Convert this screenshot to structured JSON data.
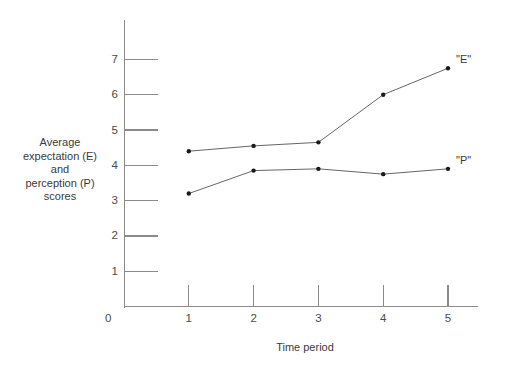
{
  "chart_data": {
    "type": "line",
    "title": "",
    "xlabel": "Time period",
    "ylabel": "Average expectation (E) and perception (P) scores",
    "x": [
      1,
      2,
      3,
      4,
      5
    ],
    "xticklabels": [
      "1",
      "2",
      "3",
      "4",
      "5"
    ],
    "yticklabels": [
      "1",
      "2",
      "3",
      "4",
      "5",
      "6",
      "7"
    ],
    "yticks": [
      1,
      2,
      3,
      4,
      5,
      6,
      7
    ],
    "origin_label": "0",
    "xlim": [
      0,
      5.45
    ],
    "ylim": [
      0,
      8.15
    ],
    "grid": false,
    "legend_position": "inline-right",
    "series": [
      {
        "name": "\"E\"",
        "label": "\"E\"",
        "values": [
          4.4,
          4.55,
          4.65,
          6.0,
          6.75
        ],
        "color": "#555555"
      },
      {
        "name": "\"P\"",
        "label": "\"P\"",
        "values": [
          3.2,
          3.85,
          3.9,
          3.75,
          3.9
        ],
        "color": "#555555"
      }
    ]
  },
  "axis": {
    "y_title_lines": [
      "Average",
      "expectation (E)",
      "and",
      "perception (P)",
      "scores"
    ]
  }
}
